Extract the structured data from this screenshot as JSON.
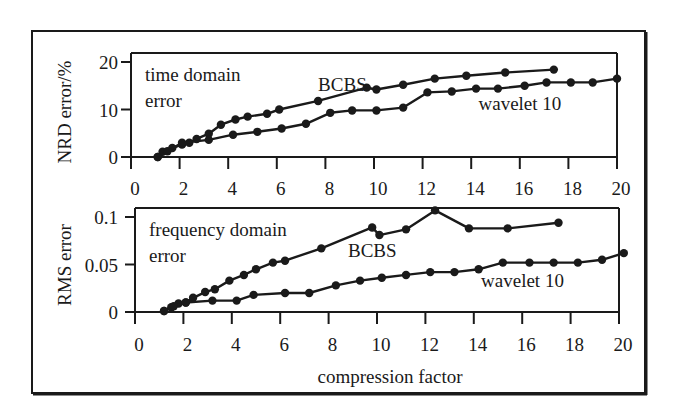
{
  "figure": {
    "xlabel": "compression factor",
    "colors": {
      "ink": "#1a1a1a",
      "background": "#ffffff"
    }
  },
  "chart_data": [
    {
      "type": "line",
      "title": "time domain error",
      "annotation_lines": [
        "time domain",
        "error"
      ],
      "xlabel": "compression factor",
      "ylabel": "NRD error/%",
      "xlim": [
        0,
        20
      ],
      "ylim": [
        0,
        20
      ],
      "xticks": [
        0,
        2,
        4,
        6,
        8,
        10,
        12,
        14,
        16,
        18,
        20
      ],
      "yticks": [
        0,
        10,
        20
      ],
      "ytick_labels": [
        "0",
        "10",
        "20"
      ],
      "grid": false,
      "legend": "inline labels",
      "series": [
        {
          "name": "BCBS",
          "label_pos": [
            7.7,
            13.8
          ],
          "x": [
            1.1,
            1.3,
            1.7,
            2.1,
            2.4,
            2.7,
            3.2,
            3.7,
            4.3,
            4.8,
            5.6,
            6.1,
            7.7,
            9.7,
            10.1,
            11.2,
            12.5,
            13.8,
            15.4,
            17.4
          ],
          "y": [
            0.0,
            1.1,
            1.9,
            2.6,
            3.0,
            3.8,
            4.9,
            6.8,
            7.9,
            8.5,
            9.1,
            10.0,
            11.8,
            14.6,
            14.2,
            15.2,
            16.5,
            17.1,
            17.8,
            18.4
          ]
        },
        {
          "name": "wavelet 10",
          "label_pos": [
            14.3,
            9.8
          ],
          "x": [
            1.1,
            1.5,
            2.1,
            3.2,
            4.2,
            5.2,
            6.2,
            7.2,
            8.2,
            9.1,
            10.1,
            11.2,
            12.2,
            13.2,
            14.2,
            15.1,
            16.2,
            17.1,
            18.1,
            19.0,
            20.0
          ],
          "y": [
            0.0,
            1.2,
            3.0,
            3.6,
            4.7,
            5.3,
            6.0,
            7.0,
            9.3,
            9.8,
            9.8,
            10.4,
            13.6,
            13.8,
            14.4,
            14.4,
            15.0,
            15.7,
            15.7,
            15.7,
            16.5
          ]
        }
      ]
    },
    {
      "type": "line",
      "title": "frequency domain error",
      "annotation_lines": [
        "frequency domain",
        "error"
      ],
      "xlabel": "compression factor",
      "ylabel": "RMS error",
      "xlim": [
        0,
        20
      ],
      "ylim": [
        0,
        0.1
      ],
      "xticks": [
        0,
        2,
        4,
        6,
        8,
        10,
        12,
        14,
        16,
        18,
        20
      ],
      "yticks": [
        0,
        0.05,
        0.1
      ],
      "ytick_labels": [
        "0",
        "0.05",
        "0.1"
      ],
      "grid": false,
      "legend": "inline labels",
      "series": [
        {
          "name": "BCBS",
          "label_pos": [
            8.8,
            0.058
          ],
          "x": [
            1.2,
            1.5,
            1.8,
            2.1,
            2.4,
            2.9,
            3.3,
            3.9,
            4.5,
            5.0,
            5.7,
            6.2,
            7.7,
            9.8,
            10.1,
            11.2,
            12.4,
            13.8,
            15.4,
            17.5
          ],
          "y": [
            0.001,
            0.005,
            0.009,
            0.01,
            0.015,
            0.021,
            0.024,
            0.033,
            0.039,
            0.045,
            0.052,
            0.054,
            0.067,
            0.089,
            0.081,
            0.087,
            0.107,
            0.088,
            0.088,
            0.094
          ]
        },
        {
          "name": "wavelet 10",
          "label_pos": [
            14.3,
            0.026
          ],
          "x": [
            1.2,
            1.6,
            2.1,
            3.2,
            4.2,
            4.9,
            6.2,
            7.2,
            8.3,
            9.3,
            10.2,
            11.2,
            12.2,
            13.2,
            14.2,
            15.2,
            16.3,
            17.3,
            18.3,
            19.3,
            20.2
          ],
          "y": [
            0.001,
            0.006,
            0.01,
            0.012,
            0.012,
            0.018,
            0.02,
            0.02,
            0.028,
            0.033,
            0.036,
            0.039,
            0.042,
            0.042,
            0.045,
            0.052,
            0.052,
            0.052,
            0.052,
            0.055,
            0.062
          ]
        }
      ]
    }
  ]
}
